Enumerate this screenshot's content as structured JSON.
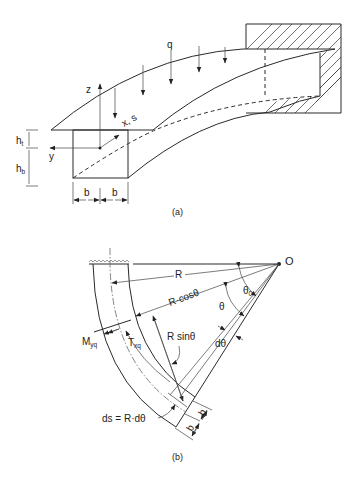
{
  "figure_a": {
    "caption": "(a)",
    "labels": {
      "load": "q",
      "z_axis": "z",
      "y_axis": "y",
      "x_axis": "x, s",
      "h_top": "h",
      "h_top_sub": "t",
      "h_bottom": "h",
      "h_bottom_sub": "b",
      "width_left": "b",
      "width_right": "b"
    }
  },
  "figure_b": {
    "caption": "(b)",
    "labels": {
      "center": "O",
      "radius": "R",
      "r_cos": "R·cosθ",
      "r_sin": "R sinθ",
      "theta0": "θ",
      "theta0_sub": "0",
      "theta": "θ",
      "dtheta": "dθ",
      "moment": "M",
      "moment_sub": "yq",
      "torque": "T",
      "torque_sub": "xq",
      "arc_length": "ds = R·dθ",
      "width_1": "b",
      "width_2": "b"
    }
  }
}
